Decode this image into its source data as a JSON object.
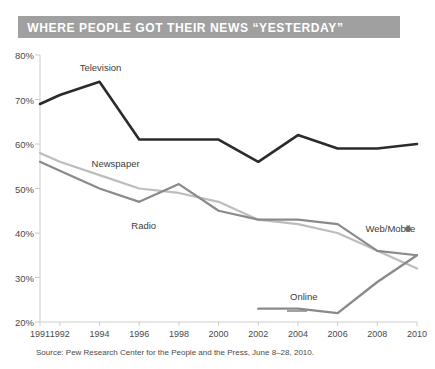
{
  "title": "WHERE PEOPLE GOT THEIR NEWS “YESTERDAY”",
  "source": "Source: Pew Research Center for the People and the Press, June 8–28, 2010.",
  "colors": {
    "banner": "#a0a0a0",
    "banner_text": "#ffffff",
    "television": "#2b2b2b",
    "newspaper": "#bdbdbd",
    "radio": "#8a8a8a",
    "online": "#8a8a8a",
    "axis": "#cccccc",
    "text": "#4a4a4a"
  },
  "labels": {
    "television": "Television",
    "newspaper": "Newspaper",
    "radio": "Radio",
    "online": "Online",
    "webmobile": "Web/Mobile"
  },
  "chart_data": {
    "type": "line",
    "title": "WHERE PEOPLE GOT THEIR NEWS “YESTERDAY”",
    "xlabel": "",
    "ylabel": "",
    "ylim": [
      20,
      80
    ],
    "yticks": [
      20,
      30,
      40,
      50,
      60,
      70,
      80
    ],
    "ytick_labels": [
      "20%",
      "30%",
      "40%",
      "50%",
      "60%",
      "70%",
      "80%"
    ],
    "x": [
      1991,
      1992,
      1994,
      1996,
      1998,
      2000,
      2002,
      2004,
      2006,
      2008,
      2010
    ],
    "xtick_labels": [
      "1991",
      "1992",
      "1994",
      "1996",
      "1998",
      "2000",
      "2002",
      "2004",
      "2006",
      "2008",
      "2010"
    ],
    "grid": false,
    "legend": "inline-labels",
    "series": [
      {
        "name": "Television",
        "color": "#2b2b2b",
        "width": 2.6,
        "x": [
          1991,
          1992,
          1994,
          1996,
          1998,
          2000,
          2002,
          2004,
          2006,
          2008,
          2010
        ],
        "values": [
          69,
          71,
          74,
          61,
          61,
          61,
          56,
          62,
          59,
          59,
          60
        ]
      },
      {
        "name": "Newspaper",
        "color": "#bdbdbd",
        "width": 2.2,
        "x": [
          1991,
          1992,
          1994,
          1996,
          1998,
          2000,
          2002,
          2004,
          2006,
          2008,
          2010
        ],
        "values": [
          58,
          56,
          53,
          50,
          49,
          47,
          43,
          42,
          40,
          36,
          32
        ]
      },
      {
        "name": "Radio",
        "color": "#8a8a8a",
        "width": 2.2,
        "x": [
          1991,
          1992,
          1994,
          1996,
          1998,
          2000,
          2002,
          2004,
          2006,
          2008,
          2010
        ],
        "values": [
          56,
          54,
          50,
          47,
          51,
          45,
          43,
          43,
          42,
          36,
          35
        ]
      },
      {
        "name": "Online",
        "color": "#8a8a8a",
        "width": 2.4,
        "x": [
          2002,
          2004,
          2006,
          2008,
          2010
        ],
        "values": [
          23,
          23,
          22,
          29,
          35
        ]
      }
    ],
    "points": [
      {
        "name": "Web/Mobile",
        "color": "#6e6e6e",
        "x": 2010,
        "y": 41
      }
    ],
    "annotations": [
      {
        "text": "Television",
        "x": 1993.0,
        "y": 77.0
      },
      {
        "text": "Newspaper",
        "x": 1993.6,
        "y": 55.6
      },
      {
        "text": "Radio",
        "x": 1995.6,
        "y": 41.5
      },
      {
        "text": "Online",
        "x": 2003.6,
        "y": 25.6
      },
      {
        "text": "Web/Mobile",
        "x": 2007.4,
        "y": 41.0
      }
    ]
  }
}
